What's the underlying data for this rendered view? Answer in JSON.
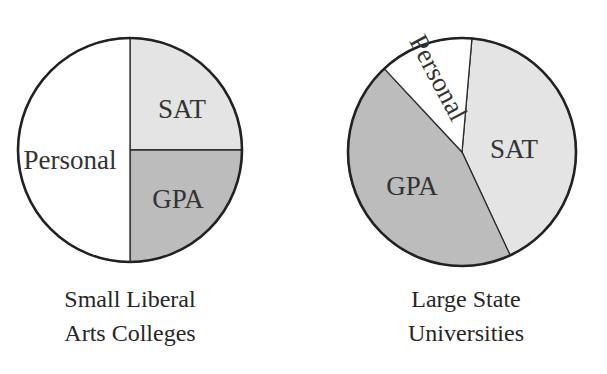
{
  "chart_data": [
    {
      "type": "pie",
      "title": "Small Liberal Arts Colleges",
      "title_lines": [
        "Small Liberal",
        "Arts Colleges"
      ],
      "categories": [
        "SAT",
        "GPA",
        "Personal"
      ],
      "values": [
        25,
        25,
        50
      ],
      "unit": "percent (estimated from slice angles; no values printed)",
      "colors": {
        "SAT": "#e4e4e4",
        "GPA": "#bcbcbc",
        "Personal": "#ffffff"
      },
      "geometry": {
        "cx": 130,
        "cy": 150,
        "r": 112
      },
      "slices": [
        {
          "label": "SAT",
          "start_deg": 0,
          "end_deg": 90,
          "label_x": 182,
          "label_y": 112,
          "label_rotate": 0
        },
        {
          "label": "GPA",
          "start_deg": 90,
          "end_deg": 180,
          "label_x": 178,
          "label_y": 202,
          "label_rotate": 0
        },
        {
          "label": "Personal",
          "start_deg": 180,
          "end_deg": 360,
          "label_x": 70,
          "label_y": 163,
          "label_rotate": 0
        }
      ],
      "legend": "none"
    },
    {
      "type": "pie",
      "title": "Large State Universities",
      "title_lines": [
        "Large State",
        "Universities"
      ],
      "categories": [
        "SAT",
        "GPA",
        "Personal"
      ],
      "values": [
        42,
        45,
        13
      ],
      "unit": "percent (estimated from slice angles; no values printed)",
      "colors": {
        "SAT": "#e4e4e4",
        "GPA": "#bcbcbc",
        "Personal": "#ffffff"
      },
      "geometry": {
        "cx": 462,
        "cy": 152,
        "r": 114
      },
      "slices": [
        {
          "label": "SAT",
          "start_deg": 5,
          "end_deg": 155,
          "label_x": 514,
          "label_y": 152,
          "label_rotate": 0
        },
        {
          "label": "GPA",
          "start_deg": 155,
          "end_deg": 317,
          "label_x": 412,
          "label_y": 189,
          "label_rotate": 0
        },
        {
          "label": "Personal",
          "start_deg": -43,
          "end_deg": 5,
          "label_x": 436,
          "label_y": 79,
          "label_rotate": 62
        }
      ],
      "legend": "none"
    }
  ]
}
